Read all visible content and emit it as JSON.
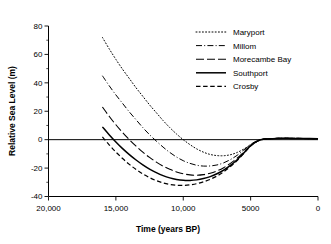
{
  "chart_data": {
    "type": "line",
    "title": "",
    "xlabel": "Time (years BP)",
    "ylabel": "Relative Sea Level (m)",
    "xlim": [
      20000,
      0
    ],
    "ylim": [
      -40,
      80
    ],
    "x_ticks": [
      20000,
      15000,
      10000,
      5000,
      0
    ],
    "x_tick_labels": [
      "20,000",
      "15,000",
      "10,000",
      "5000",
      "0"
    ],
    "y_ticks": [
      -40,
      -20,
      0,
      20,
      40,
      60,
      80
    ],
    "y_tick_labels": [
      "-40",
      "-20",
      "0",
      "20",
      "40",
      "60",
      "80"
    ],
    "y_minor_ticks": [
      -30,
      -10,
      10,
      30,
      50,
      70
    ],
    "grid": false,
    "zero_line": true,
    "legend_position": "upper right",
    "series": [
      {
        "name": "Maryport",
        "style": "dotted",
        "x": [
          16000,
          15500,
          15000,
          14500,
          14000,
          13500,
          13000,
          12500,
          12000,
          11500,
          11000,
          10500,
          10000,
          9500,
          9000,
          8500,
          8000,
          7500,
          7000,
          6500,
          6000,
          5500,
          5000,
          4500,
          4000,
          3000,
          2000,
          1000,
          0
        ],
        "y": [
          72.0,
          64.0,
          56.5,
          49.5,
          43.0,
          36.5,
          30.5,
          24.5,
          19.0,
          13.5,
          8.5,
          4.0,
          0.0,
          -3.5,
          -6.5,
          -8.8,
          -10.4,
          -11.2,
          -11.3,
          -10.6,
          -9.0,
          -6.6,
          -3.6,
          -1.2,
          0.2,
          0.9,
          0.9,
          0.8,
          0.6
        ]
      },
      {
        "name": "Millom",
        "style": "dashdot",
        "x": [
          16000,
          15500,
          15000,
          14500,
          14000,
          13500,
          13000,
          12500,
          12000,
          11500,
          11000,
          10500,
          10000,
          9500,
          9000,
          8500,
          8000,
          7500,
          7000,
          6500,
          6000,
          5500,
          5000,
          4500,
          4000,
          3000,
          2000,
          1000,
          0
        ],
        "y": [
          45.0,
          38.0,
          31.5,
          25.5,
          19.5,
          14.0,
          8.5,
          3.5,
          -1.0,
          -5.2,
          -9.0,
          -12.2,
          -14.8,
          -16.7,
          -18.0,
          -18.6,
          -18.5,
          -17.8,
          -16.3,
          -14.0,
          -11.0,
          -7.2,
          -3.3,
          -0.8,
          0.4,
          0.9,
          0.9,
          0.8,
          0.6
        ]
      },
      {
        "name": "Morecambe Bay",
        "style": "longdash",
        "x": [
          16000,
          15500,
          15000,
          14500,
          14000,
          13500,
          13000,
          12500,
          12000,
          11500,
          11000,
          10500,
          10000,
          9500,
          9000,
          8500,
          8000,
          7500,
          7000,
          6500,
          6000,
          5500,
          5000,
          4500,
          4000,
          3000,
          2000,
          1000,
          0
        ],
        "y": [
          23.0,
          16.5,
          10.5,
          5.0,
          0.0,
          -4.6,
          -8.8,
          -12.5,
          -15.8,
          -18.6,
          -20.9,
          -22.7,
          -24.0,
          -24.8,
          -25.0,
          -24.6,
          -23.6,
          -22.0,
          -19.7,
          -16.7,
          -13.0,
          -8.6,
          -4.0,
          -0.9,
          0.4,
          0.9,
          0.9,
          0.8,
          0.6
        ]
      },
      {
        "name": "Southport",
        "style": "solid",
        "x": [
          16000,
          15500,
          15000,
          14500,
          14000,
          13500,
          13000,
          12500,
          12000,
          11500,
          11000,
          10500,
          10000,
          9500,
          9000,
          8500,
          8000,
          7500,
          7000,
          6500,
          6000,
          5500,
          5000,
          4500,
          4000,
          3000,
          2000,
          1000,
          0
        ],
        "y": [
          9.0,
          3.5,
          -1.6,
          -6.3,
          -10.5,
          -14.3,
          -17.7,
          -20.7,
          -23.2,
          -25.3,
          -26.9,
          -28.0,
          -28.6,
          -28.7,
          -28.3,
          -27.4,
          -26.0,
          -24.0,
          -21.4,
          -18.1,
          -14.1,
          -9.3,
          -4.3,
          -1.0,
          0.4,
          0.9,
          0.9,
          0.8,
          0.6
        ]
      },
      {
        "name": "Crosby",
        "style": "dashed",
        "x": [
          16000,
          15500,
          15000,
          14500,
          14000,
          13500,
          13000,
          12500,
          12000,
          11500,
          11000,
          10500,
          10000,
          9500,
          9000,
          8500,
          8000,
          7500,
          7000,
          6500,
          6000,
          5500,
          5000,
          4500,
          4000,
          3000,
          2000,
          1000,
          0
        ],
        "y": [
          2.0,
          -3.6,
          -8.7,
          -13.3,
          -17.4,
          -21.0,
          -24.1,
          -26.7,
          -28.8,
          -30.4,
          -31.5,
          -32.1,
          -32.2,
          -31.8,
          -31.0,
          -29.7,
          -27.9,
          -25.6,
          -22.6,
          -19.0,
          -14.7,
          -9.7,
          -4.5,
          -1.1,
          0.4,
          0.9,
          0.9,
          0.8,
          0.6
        ]
      }
    ]
  },
  "legend": {
    "entries": [
      {
        "label": "Maryport"
      },
      {
        "label": "Millom"
      },
      {
        "label": "Morecambe Bay"
      },
      {
        "label": "Southport"
      },
      {
        "label": "Crosby"
      }
    ]
  }
}
